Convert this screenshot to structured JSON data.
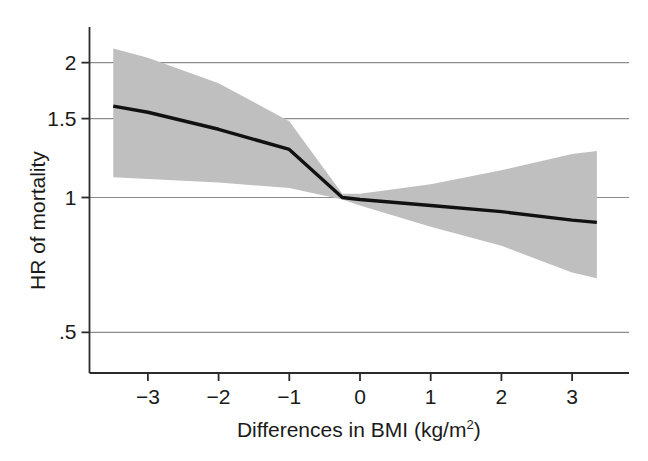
{
  "figure": {
    "background_color": "#ffffff",
    "axis_color": "#2b2b2b",
    "grid_color": "#8c8c8c",
    "band_color": "#bfbfbf",
    "line_color": "#111111"
  },
  "axes": {
    "y_title": "HR of mortality",
    "x_title_main": "Differences in BMI (kg/m",
    "x_title_superscript": "2",
    "x_title_tail": ")",
    "x_title_full": "Differences in BMI (kg/m2)",
    "y_ticks": [
      {
        "label": "2",
        "value": 2
      },
      {
        "label": "1.5",
        "value": 1.5
      },
      {
        "label": "1",
        "value": 1
      },
      {
        "label": ".5",
        "value": 0.5
      }
    ],
    "x_ticks": [
      {
        "label": "−3",
        "value": -3
      },
      {
        "label": "−2",
        "value": -2
      },
      {
        "label": "−1",
        "value": -1
      },
      {
        "label": "0",
        "value": 0
      },
      {
        "label": "1",
        "value": 1
      },
      {
        "label": "2",
        "value": 2
      },
      {
        "label": "3",
        "value": 3
      }
    ]
  },
  "chart_data": {
    "type": "line",
    "title": "",
    "xlabel": "Differences in BMI (kg/m2)",
    "ylabel": "HR of mortality",
    "xlim": [
      -3.8,
      3.7
    ],
    "ylim": [
      0.43,
      2.3
    ],
    "yscale": "log",
    "grid": "horizontal",
    "gridlines_y": [
      2,
      1.5,
      1,
      0.5
    ],
    "legend": "none",
    "reference_line_y": 1,
    "series": [
      {
        "name": "HR of mortality (fitted)",
        "type": "line",
        "x": [
          -3.49,
          -3.0,
          -2.0,
          -1.0,
          -0.25,
          0.0,
          1.0,
          2.0,
          3.0,
          3.35
        ],
        "y": [
          1.6,
          1.55,
          1.42,
          1.28,
          1.0,
          0.99,
          0.96,
          0.93,
          0.89,
          0.88
        ]
      },
      {
        "name": "95% CI upper bound",
        "type": "band_upper",
        "x": [
          -3.49,
          -3.0,
          -2.0,
          -1.0,
          -0.25,
          0.0,
          1.0,
          2.0,
          3.0,
          3.35
        ],
        "y": [
          2.15,
          2.05,
          1.8,
          1.48,
          1.02,
          1.02,
          1.07,
          1.15,
          1.25,
          1.27
        ]
      },
      {
        "name": "95% CI lower bound",
        "type": "band_lower",
        "x": [
          -3.49,
          -3.0,
          -2.0,
          -1.0,
          -0.25,
          0.0,
          1.0,
          2.0,
          3.0,
          3.35
        ],
        "y": [
          1.11,
          1.1,
          1.08,
          1.05,
          0.99,
          0.96,
          0.86,
          0.78,
          0.68,
          0.66
        ]
      }
    ]
  }
}
